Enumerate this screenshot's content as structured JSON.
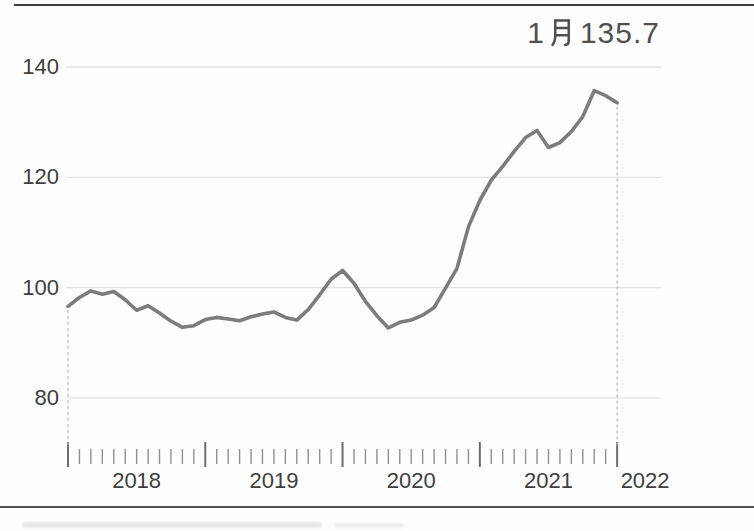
{
  "chart_data": {
    "type": "line",
    "title": "",
    "xlabel": "",
    "ylabel": "",
    "grid": true,
    "legend": "none",
    "y_ticks": [
      80,
      100,
      120,
      140
    ],
    "ylim": [
      72,
      145
    ],
    "x_year_labels": [
      "2018",
      "2019",
      "2020",
      "2021",
      "2022"
    ],
    "frequency": "monthly",
    "categories": [
      "2018-01",
      "2018-02",
      "2018-03",
      "2018-04",
      "2018-05",
      "2018-06",
      "2018-07",
      "2018-08",
      "2018-09",
      "2018-10",
      "2018-11",
      "2018-12",
      "2019-01",
      "2019-02",
      "2019-03",
      "2019-04",
      "2019-05",
      "2019-06",
      "2019-07",
      "2019-08",
      "2019-09",
      "2019-10",
      "2019-11",
      "2019-12",
      "2020-01",
      "2020-02",
      "2020-03",
      "2020-04",
      "2020-05",
      "2020-06",
      "2020-07",
      "2020-08",
      "2020-09",
      "2020-10",
      "2020-11",
      "2020-12",
      "2021-01",
      "2021-02",
      "2021-03",
      "2021-04",
      "2021-05",
      "2021-06",
      "2021-07",
      "2021-08",
      "2021-09",
      "2021-10",
      "2021-11",
      "2021-12",
      "2022-01"
    ],
    "values": [
      96.6,
      98.2,
      99.4,
      98.8,
      99.3,
      97.8,
      95.9,
      96.7,
      95.4,
      93.9,
      92.8,
      93.1,
      94.2,
      94.6,
      94.3,
      94.0,
      94.7,
      95.2,
      95.6,
      94.6,
      94.1,
      96.0,
      98.7,
      101.5,
      103.1,
      100.8,
      97.5,
      94.9,
      92.7,
      93.7,
      94.1,
      95.0,
      96.4,
      99.9,
      103.5,
      111.0,
      115.8,
      119.5,
      122.0,
      124.7,
      127.2,
      128.5,
      125.4,
      126.3,
      128.3,
      131.0,
      135.7,
      134.8,
      133.5
    ],
    "annotation": {
      "text": "1月 135.7",
      "prefix": "1",
      "month_char": "月",
      "value": "135.7"
    },
    "colors": {
      "line": "#7c7c7c",
      "grid": "#e2e2e2",
      "tick_short": "#8f8f8f",
      "tick_long": "#6d6d6d",
      "dashed": "#b3b3b3",
      "label": "#3e3e3e",
      "annotation": "#4f4f4f",
      "border": "#3f3f3f"
    }
  }
}
